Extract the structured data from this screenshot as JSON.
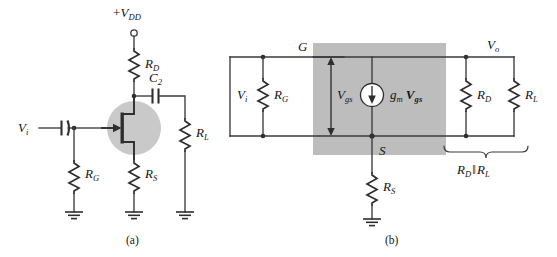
{
  "figure": {
    "captions": {
      "a": "(a)",
      "b": "(b)"
    },
    "colors": {
      "background": "#ffffff",
      "wire": "#3a3a3a",
      "component": "#2e2e2e",
      "shade_box": "#bdbdbd",
      "halo_circle": "#c9c9c9",
      "source_fill": "#ffffff"
    }
  },
  "circuit_a": {
    "name": "JFET common-source amplifier (network)",
    "labels": {
      "supply": "+V",
      "supply_sub": "DD",
      "input": "V",
      "input_sub": "i",
      "r_drain": "R",
      "r_drain_sub": "D",
      "r_gate": "R",
      "r_gate_sub": "G",
      "r_source": "R",
      "r_source_sub": "S",
      "r_load": "R",
      "r_load_sub": "L",
      "cap_out": "C",
      "cap_out_sub": "2"
    },
    "components": [
      {
        "id": "supply-terminal",
        "type": "open-terminal",
        "label": "+V_DD"
      },
      {
        "id": "r-drain",
        "type": "resistor",
        "label": "R_D"
      },
      {
        "id": "c2",
        "type": "capacitor",
        "label": "C_2"
      },
      {
        "id": "c1",
        "type": "capacitor",
        "label": ""
      },
      {
        "id": "jfet",
        "type": "n-channel-jfet",
        "label": ""
      },
      {
        "id": "r-gate",
        "type": "resistor",
        "label": "R_G"
      },
      {
        "id": "r-source",
        "type": "resistor",
        "label": "R_S"
      },
      {
        "id": "r-load",
        "type": "resistor",
        "label": "R_L"
      },
      {
        "id": "gnd-gate",
        "type": "ground",
        "label": ""
      },
      {
        "id": "gnd-source",
        "type": "ground",
        "label": ""
      },
      {
        "id": "gnd-load",
        "type": "ground",
        "label": ""
      }
    ]
  },
  "circuit_b": {
    "name": "Small-signal ac equivalent circuit",
    "labels": {
      "input": "V",
      "input_sub": "i",
      "gate_node": "G",
      "source_node": "S",
      "output": "V",
      "output_sub": "o",
      "r_gate": "R",
      "r_gate_sub": "G",
      "r_drain": "R",
      "r_drain_sub": "D",
      "r_load": "R",
      "r_load_sub": "L",
      "r_source": "R",
      "r_source_sub": "S",
      "v_gs": "V",
      "v_gs_sub": "gs",
      "current_source_gm": "g",
      "current_source_gm_sub": "m",
      "current_source_v": "V",
      "current_source_v_sub": "gs",
      "brace_first": "R",
      "brace_first_sub": "D",
      "brace_parallel": "‖",
      "brace_second": "R",
      "brace_second_sub": "L"
    },
    "components": [
      {
        "id": "r-gate",
        "type": "resistor",
        "label": "R_G"
      },
      {
        "id": "current-source",
        "type": "dependent-current-source",
        "label": "g_m V_gs",
        "direction": "down"
      },
      {
        "id": "r-drain",
        "type": "resistor",
        "label": "R_D"
      },
      {
        "id": "r-load",
        "type": "resistor",
        "label": "R_L"
      },
      {
        "id": "r-source",
        "type": "resistor",
        "label": "R_S"
      },
      {
        "id": "gnd-source",
        "type": "ground",
        "label": ""
      },
      {
        "id": "vgs-arrow",
        "type": "double-arrow",
        "label": "V_gs"
      },
      {
        "id": "brace",
        "type": "brace",
        "label": "R_D ‖ R_L"
      }
    ]
  }
}
